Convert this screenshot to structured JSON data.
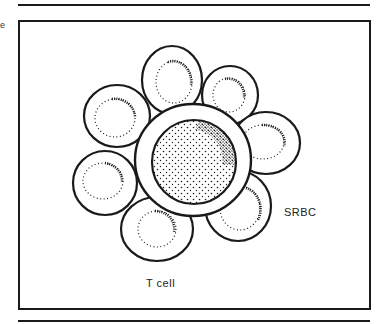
{
  "figure": {
    "labels": {
      "srbc": "SRBC",
      "t_cell": "T cell"
    },
    "edge_text": "e",
    "colors": {
      "stroke": "#1a1a1a",
      "background": "#ffffff"
    },
    "center_cell": {
      "cx": 193,
      "cy": 160,
      "r": 57,
      "nucleus_r": 42
    },
    "srbc_cells": [
      {
        "name": "top",
        "cx": 172,
        "cy": 80,
        "r": 33
      },
      {
        "name": "top-right",
        "cx": 230,
        "cy": 95,
        "r": 29
      },
      {
        "name": "right",
        "cx": 266,
        "cy": 143,
        "r": 32
      },
      {
        "name": "lower-right",
        "cx": 238,
        "cy": 206,
        "r": 33
      },
      {
        "name": "bottom",
        "cx": 157,
        "cy": 229,
        "r": 35
      },
      {
        "name": "left",
        "cx": 105,
        "cy": 183,
        "r": 32
      },
      {
        "name": "top-left",
        "cx": 117,
        "cy": 116,
        "r": 33
      }
    ]
  }
}
